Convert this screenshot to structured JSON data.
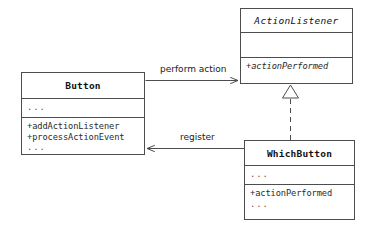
{
  "diagram": {
    "kind": "uml-class-diagram",
    "width": 370,
    "height": 231,
    "background_color": "#ffffff",
    "line_color": "#4d4d4d",
    "text_color": "#111111"
  },
  "classes": {
    "action_listener": {
      "name": "ActionListener",
      "stereotype": "interface",
      "is_abstract": true,
      "attributes_placeholder": "",
      "operations": [
        "+actionPerformed"
      ]
    },
    "button": {
      "name": "Button",
      "stereotype": "class",
      "is_abstract": false,
      "attributes_placeholder": "...",
      "operations": [
        "+addActionListener",
        "+processActionEvent"
      ],
      "operations_placeholder": "..."
    },
    "which_button": {
      "name": "WhichButton",
      "stereotype": "class",
      "is_abstract": false,
      "attributes_placeholder": "...",
      "operations": [
        "+actionPerformed"
      ],
      "operations_placeholder": "..."
    }
  },
  "relationships": {
    "perform_action": {
      "label": "perform action",
      "type": "association",
      "line_style": "solid",
      "arrow": "open",
      "from": "Button",
      "to": "ActionListener"
    },
    "register": {
      "label": "register",
      "type": "association",
      "line_style": "solid",
      "arrow": "open",
      "from": "WhichButton",
      "to": "Button"
    },
    "realization": {
      "label": "",
      "type": "realization",
      "line_style": "dashed",
      "arrow": "hollow-triangle",
      "from": "WhichButton",
      "to": "ActionListener"
    }
  }
}
